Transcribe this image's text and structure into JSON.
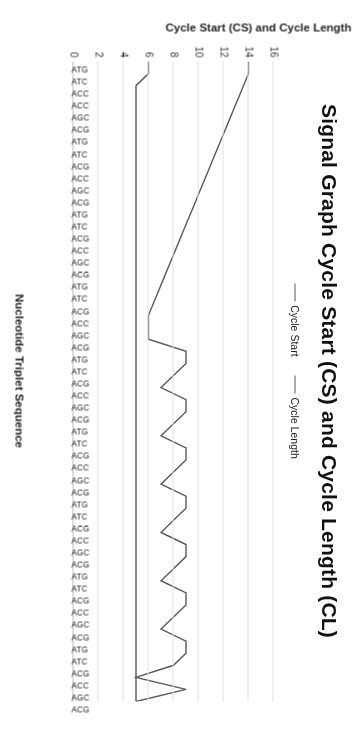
{
  "chart_data": {
    "type": "line",
    "title": "Signal Graph Cycle Start (CS) and Cycle Length (CL)",
    "xlabel": "Nucleotide Triplet Sequence",
    "ylabel": "Cycle Start (CS) and Cycle Length (CL)",
    "ylim": [
      0,
      16
    ],
    "yticks": [
      0,
      2,
      4,
      6,
      8,
      10,
      12,
      14,
      16
    ],
    "grid": true,
    "legend_position": "top-center",
    "legend": [
      "Cycle Start",
      "Cycle Length"
    ],
    "categories": [
      "ATG",
      "ATC",
      "ACC",
      "ACC",
      "AGC",
      "ACG",
      "ATG",
      "ATC",
      "ACG",
      "ACC",
      "AGC",
      "ACG",
      "ATG",
      "ATC",
      "ACG",
      "ACC",
      "AGC",
      "ACG",
      "ATG",
      "ATC",
      "ACG",
      "ACC",
      "AGC",
      "ACG",
      "ATG",
      "ATC",
      "ACG",
      "ACC",
      "AGC",
      "ACG",
      "ATG",
      "ATC",
      "ACG",
      "ACC",
      "AGC",
      "ACG",
      "ATG",
      "ATC",
      "ACG",
      "ACC",
      "AGC",
      "ACG",
      "ATG",
      "ATC",
      "ACG",
      "ACC",
      "AGC",
      "ACG",
      "ATG",
      "ATC",
      "ACG",
      "ACC",
      "AGC",
      "ACG"
    ],
    "series": [
      {
        "name": "Cycle Start",
        "color": "#595959",
        "values": [
          6,
          6,
          5,
          5,
          5,
          5,
          5,
          5,
          5,
          5,
          5,
          5,
          5,
          5,
          5,
          5,
          5,
          5,
          5,
          5,
          5,
          5,
          5,
          5,
          5,
          5,
          5,
          5,
          5,
          5,
          5,
          5,
          5,
          5,
          5,
          5,
          5,
          5,
          5,
          5,
          5,
          5,
          5,
          5,
          5,
          5,
          5,
          5,
          5,
          5,
          5,
          5,
          5,
          5
        ]
      },
      {
        "name": "Cycle Length",
        "color": "#595959",
        "values": [
          14,
          14,
          13.6,
          13.2,
          12.8,
          12.4,
          12,
          11.6,
          11.2,
          10.8,
          10.4,
          10,
          9.6,
          9.2,
          8.8,
          8.4,
          8,
          7.6,
          7.2,
          6.8,
          6.4,
          6,
          6,
          6,
          9,
          9,
          8,
          7,
          9,
          9,
          8,
          7,
          9,
          9,
          8,
          7,
          9,
          9,
          8,
          7,
          9,
          9,
          8,
          7,
          9,
          9,
          8,
          7,
          9,
          9,
          8,
          5,
          9,
          5
        ]
      }
    ],
    "annotations": [
      {
        "label": "terminal-spike",
        "x_index": 52,
        "y": 9
      }
    ]
  }
}
